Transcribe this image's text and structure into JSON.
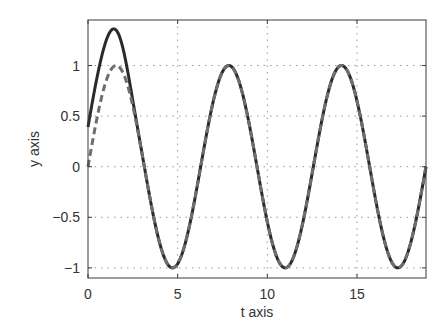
{
  "chart_data": {
    "type": "line",
    "title": "",
    "xlabel": "t axis",
    "ylabel": "y axis",
    "xlim": [
      0,
      18.85
    ],
    "ylim": [
      -1.1,
      1.45
    ],
    "grid": true,
    "legend": null,
    "xticks": [
      0,
      5,
      10,
      15
    ],
    "yticks": [
      1,
      0.5,
      0,
      -0.5,
      -1
    ],
    "xtick_labels": [
      "0",
      "5",
      "10",
      "15"
    ],
    "ytick_labels": [
      "1",
      "0.5",
      "0",
      "−0.5",
      "−1"
    ],
    "series": [
      {
        "name": "solution (solid)",
        "style": "solid",
        "color": "#2a2a2a",
        "description": "Starts near 0.4 at t=0, peaks ~1.35 at t~1.5, then converges to sin(t)",
        "x": [
          0,
          0.5,
          1.0,
          1.5,
          2.0,
          2.5,
          3.0,
          4.71,
          7.85,
          11.0,
          14.14,
          17.28,
          18.85
        ],
        "y": [
          0.39,
          0.87,
          1.24,
          1.35,
          1.19,
          0.65,
          0.14,
          -1.0,
          1.0,
          -1.0,
          1.0,
          -1.0,
          0.0
        ]
      },
      {
        "name": "sin(t) (dashed)",
        "style": "dashed",
        "color": "#6e6e6e",
        "x": [
          0,
          1.57,
          3.14,
          4.71,
          6.28,
          7.85,
          9.42,
          11.0,
          12.57,
          14.14,
          15.71,
          17.28,
          18.85
        ],
        "y": [
          0,
          1,
          0,
          -1,
          0,
          1,
          0,
          -1,
          0,
          1,
          0,
          -1,
          0
        ]
      }
    ]
  },
  "colors": {
    "axes": "#3a3a3a",
    "grid": "#9a9a9a",
    "solid": "#2a2a2a",
    "dashed": "#6e6e6e"
  }
}
